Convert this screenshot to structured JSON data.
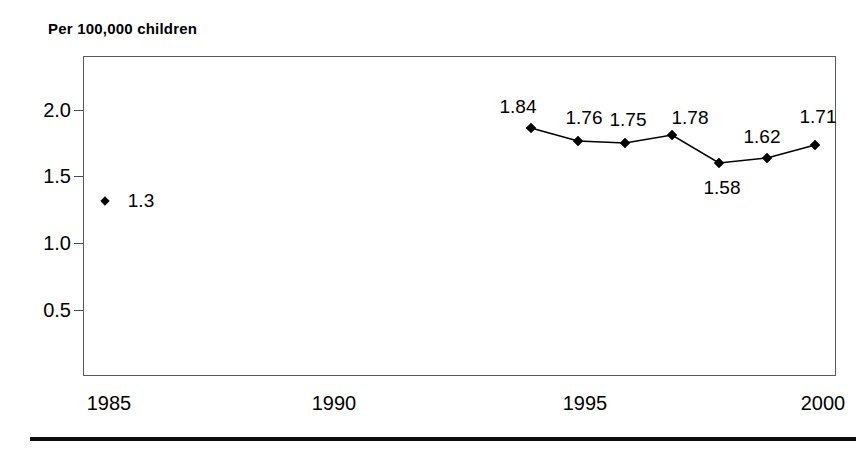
{
  "chart_data": {
    "type": "line",
    "title": "Per 100,000 children",
    "subtitle": "",
    "xlabel": "",
    "ylabel": "Per 100,000 children",
    "xlim": [
      1983.5,
      2000.8
    ],
    "ylim": [
      0,
      2.4
    ],
    "grid": false,
    "legend": "none",
    "y_ticks": [
      "2.0",
      "1.5",
      "1.0",
      "0.5"
    ],
    "y_tick_values": [
      2.0,
      1.5,
      1.0,
      0.5
    ],
    "x_ticks": [
      "1985",
      "1990",
      "1995",
      "2000"
    ],
    "x_tick_values": [
      1985,
      1990,
      1995,
      2000
    ],
    "series": [
      {
        "name": "isolated-1985",
        "connected": false,
        "x": [
          1985
        ],
        "values": [
          1.3
        ],
        "labels": [
          "1.3"
        ]
      },
      {
        "name": "rate-1994-2000",
        "connected": true,
        "x": [
          1994,
          1995,
          1996,
          1997,
          1998,
          1999,
          2000
        ],
        "values": [
          1.84,
          1.76,
          1.75,
          1.78,
          1.58,
          1.62,
          1.71
        ],
        "labels": [
          "1.84",
          "1.76",
          "1.75",
          "1.78",
          "1.58",
          "1.62",
          "1.71"
        ]
      }
    ]
  },
  "title": {
    "text": "Per 100,000 children"
  },
  "axes": {
    "y_labels": [
      {
        "text": "2.0",
        "y": 110
      },
      {
        "text": "1.5",
        "y": 176
      },
      {
        "text": "1.0",
        "y": 243
      },
      {
        "text": "0.5",
        "y": 310
      }
    ],
    "x_labels": [
      {
        "text": "1985",
        "x": 109
      },
      {
        "text": "1990",
        "x": 334
      },
      {
        "text": "1995",
        "x": 585
      },
      {
        "text": "2000",
        "x": 823
      }
    ]
  },
  "points": [
    {
      "label": "1.3",
      "value": 1.3,
      "cx": 105,
      "cy": 201,
      "lx": 141,
      "ly": 201,
      "connected": false
    },
    {
      "label": "1.84",
      "value": 1.84,
      "cx": 531,
      "cy": 128,
      "lx": 518,
      "ly": 107,
      "connected": true
    },
    {
      "label": "1.76",
      "value": 1.76,
      "cx": 578,
      "cy": 141,
      "lx": 584,
      "ly": 118,
      "connected": true
    },
    {
      "label": "1.75",
      "value": 1.75,
      "cx": 625,
      "cy": 143,
      "lx": 628,
      "ly": 120,
      "connected": true
    },
    {
      "label": "1.78",
      "value": 1.78,
      "cx": 672,
      "cy": 135,
      "lx": 690,
      "ly": 118,
      "connected": true
    },
    {
      "label": "1.58",
      "value": 1.58,
      "cx": 719,
      "cy": 163,
      "lx": 722,
      "ly": 188,
      "connected": true
    },
    {
      "label": "1.62",
      "value": 1.62,
      "cx": 767,
      "cy": 158,
      "lx": 762,
      "ly": 137,
      "connected": true
    },
    {
      "label": "1.71",
      "value": 1.71,
      "cx": 815,
      "cy": 145,
      "lx": 818,
      "ly": 117,
      "connected": true
    }
  ]
}
